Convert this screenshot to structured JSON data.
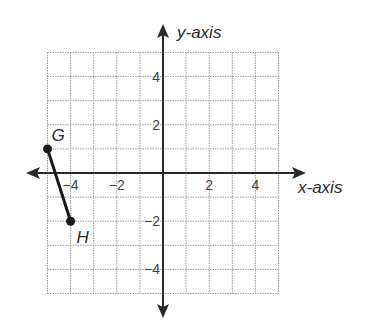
{
  "diagram": {
    "type": "coordinate-plane",
    "x_axis_label": "x-axis",
    "y_axis_label": "y-axis",
    "x_range": [
      -5,
      5
    ],
    "y_range": [
      -5,
      5
    ],
    "x_ticks": [
      {
        "value": -4,
        "label": "−4"
      },
      {
        "value": -2,
        "label": "−2"
      },
      {
        "value": 2,
        "label": "2"
      },
      {
        "value": 4,
        "label": "4"
      }
    ],
    "y_ticks": [
      {
        "value": 4,
        "label": "4"
      },
      {
        "value": 2,
        "label": "2"
      },
      {
        "value": -2,
        "label": "−2"
      },
      {
        "value": -4,
        "label": "−4"
      }
    ],
    "points": [
      {
        "name": "G",
        "x": -5,
        "y": 1
      },
      {
        "name": "H",
        "x": -4,
        "y": -2
      }
    ],
    "segments": [
      {
        "from": "G",
        "to": "H"
      }
    ],
    "colors": {
      "grid": "#9a9a9a",
      "axis": "#2a2a2a",
      "segment": "#1a1a1a"
    }
  }
}
